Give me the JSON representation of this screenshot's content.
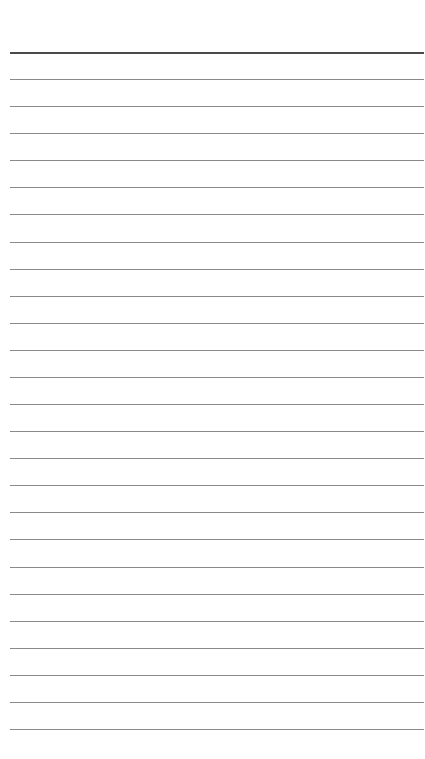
{
  "page": {
    "type": "lined-notepad-page",
    "background_color": "#ffffff",
    "line_color": "#8a8a8a",
    "header_line_color": "#4a4a4a",
    "line_count": 26,
    "first_line_y": 52,
    "line_spacing": 27.08,
    "line_left": 10,
    "line_right": 424,
    "text_lines": []
  }
}
